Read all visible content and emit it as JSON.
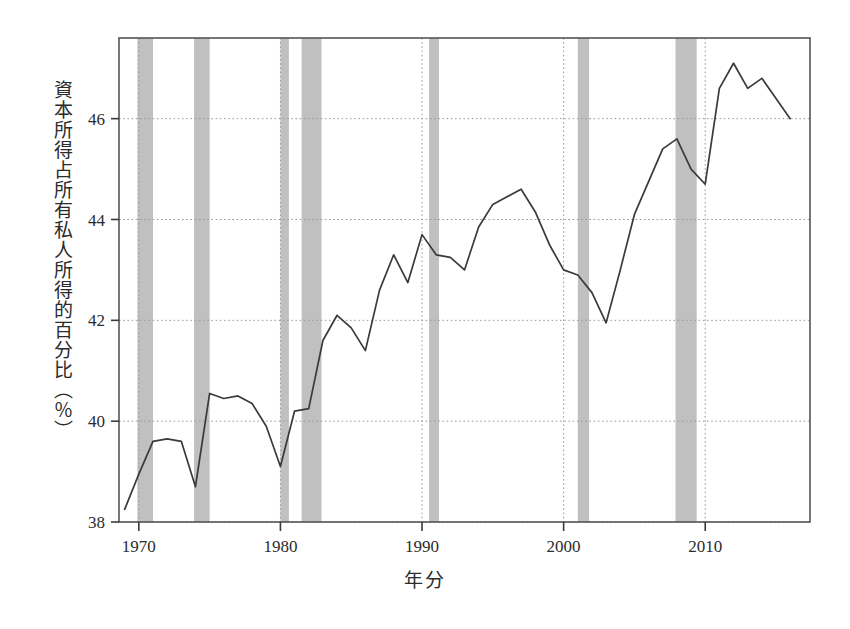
{
  "chart_data": {
    "type": "line",
    "title": "",
    "xlabel": "年分",
    "ylabel": "資本所得占所有私人所得的百分比（％）",
    "xlim": [
      1968.6,
      2017.4
    ],
    "ylim": [
      38,
      47.6
    ],
    "xticks": [
      1970,
      1980,
      1990,
      2000,
      2010
    ],
    "xticklabels": [
      "1970",
      "1980",
      "1990",
      "2000",
      "2010"
    ],
    "yticks": [
      38,
      40,
      42,
      44,
      46
    ],
    "yticklabels": [
      "38",
      "40",
      "42",
      "44",
      "46"
    ],
    "grid": true,
    "grid_style": "dotted",
    "legend": "none",
    "line_color": "#3a3a3a",
    "band_color": "#bdbdbd",
    "series": [
      {
        "name": "資本所得占所有私人所得的百分比",
        "x": [
          1969,
          1970,
          1971,
          1972,
          1973,
          1974,
          1975,
          1976,
          1977,
          1978,
          1979,
          1980,
          1981,
          1982,
          1983,
          1984,
          1985,
          1986,
          1987,
          1988,
          1989,
          1990,
          1991,
          1992,
          1993,
          1994,
          1995,
          1996,
          1997,
          1998,
          1999,
          2000,
          2001,
          2002,
          2003,
          2004,
          2005,
          2006,
          2007,
          2008,
          2009,
          2010,
          2011,
          2012,
          2013,
          2014,
          2015,
          2016
        ],
        "values": [
          38.25,
          38.95,
          39.6,
          39.65,
          39.6,
          38.7,
          40.55,
          40.45,
          40.5,
          40.35,
          39.9,
          39.1,
          40.2,
          40.25,
          41.6,
          42.1,
          41.85,
          41.4,
          42.6,
          43.3,
          42.75,
          43.7,
          43.3,
          43.25,
          43.0,
          43.85,
          44.3,
          44.45,
          44.6,
          44.15,
          43.5,
          43.0,
          42.9,
          42.55,
          41.95,
          43.0,
          44.1,
          44.75,
          45.4,
          45.6,
          45.0,
          44.7,
          46.6,
          47.1,
          46.6,
          46.8,
          46.4,
          46.0
        ]
      }
    ],
    "recession_bands": [
      {
        "start": 1969.9,
        "end": 1971.0
      },
      {
        "start": 1973.9,
        "end": 1975.0
      },
      {
        "start": 1980.0,
        "end": 1980.6
      },
      {
        "start": 1981.5,
        "end": 1982.9
      },
      {
        "start": 1990.5,
        "end": 1991.2
      },
      {
        "start": 2001.0,
        "end": 2001.8
      },
      {
        "start": 2007.9,
        "end": 2009.4
      }
    ]
  }
}
